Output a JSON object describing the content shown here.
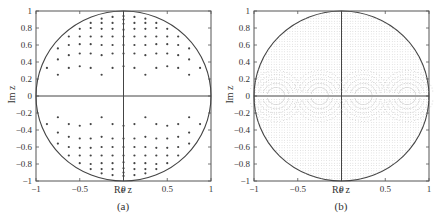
{
  "chart_data": [
    {
      "type": "scatter",
      "caption": "(a)",
      "xlabel": "Re z",
      "ylabel": "Im z",
      "xlim": [
        -1,
        1
      ],
      "ylim": [
        -1,
        1
      ],
      "xticks": [
        -1,
        -0.5,
        0,
        0.5,
        1
      ],
      "xtick_labels": [
        "−1",
        "−0.5",
        "0",
        "0.5",
        "1"
      ],
      "yticks": [
        1,
        0.8,
        0.6,
        0.4,
        0.2,
        0,
        -0.2,
        -0.4,
        -0.6,
        -0.8,
        -1
      ],
      "ytick_labels": [
        "1",
        "0.8",
        "0.6",
        "0.4",
        "0.2",
        "0",
        "−0.2",
        "−0.4",
        "−0.6",
        "−0.8",
        "−1"
      ],
      "grid": false,
      "annotations": [
        "unit circle",
        "real axis line",
        "imaginary axis line"
      ],
      "marker": "dot",
      "columns": [
        {
          "re": 0,
          "im": [
            0.35,
            0.5,
            0.6,
            0.7,
            0.78,
            0.85,
            0.9,
            0.94
          ]
        },
        {
          "re": 0.125,
          "im": [
            0.33,
            0.5,
            0.6,
            0.7,
            0.79,
            0.86,
            0.93
          ]
        },
        {
          "re": 0.25,
          "im": [
            0.25,
            0.48,
            0.6,
            0.7,
            0.79,
            0.86,
            0.91
          ]
        },
        {
          "re": 0.375,
          "im": [
            0.33,
            0.5,
            0.61,
            0.7,
            0.8,
            0.86
          ]
        },
        {
          "re": 0.5,
          "im": [
            0.35,
            0.5,
            0.61,
            0.7,
            0.79
          ]
        },
        {
          "re": 0.625,
          "im": [
            0.33,
            0.48,
            0.6,
            0.7
          ]
        },
        {
          "re": 0.75,
          "im": [
            0.25,
            0.43,
            0.56
          ]
        },
        {
          "re": 0.875,
          "im": [
            0.33
          ]
        }
      ],
      "symmetry": "points mirrored across both axes (conjugate and real-axis symmetric)"
    },
    {
      "type": "scatter",
      "caption": "(b)",
      "xlabel": "Re z",
      "ylabel": "Im z",
      "xlim": [
        -1,
        1
      ],
      "ylim": [
        -1,
        1
      ],
      "xticks": [
        -1,
        -0.5,
        0,
        0.5,
        1
      ],
      "xtick_labels": [
        "−1",
        "−0.5",
        "0",
        "0.5",
        "1"
      ],
      "yticks": [
        1,
        0.8,
        0.6,
        0.4,
        0.2,
        0,
        -0.2,
        -0.4,
        -0.6,
        -0.8,
        -1
      ],
      "ytick_labels": [
        "1",
        "0.8",
        "0.6",
        "0.4",
        "0.2",
        "0",
        "−0.2",
        "−0.4",
        "−0.6",
        "−0.8",
        "−1"
      ],
      "grid": false,
      "annotations": [
        "unit circle",
        "real axis line",
        "imaginary axis line"
      ],
      "marker": "dense fine dots filling unit disk, arc patterns near real axis",
      "density": "high"
    }
  ]
}
